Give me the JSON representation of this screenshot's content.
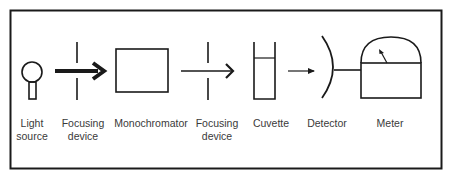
{
  "diagram": {
    "components": [
      {
        "id": "light-source",
        "label_line1": "Light",
        "label_line2": "source"
      },
      {
        "id": "focusing-device-1",
        "label_line1": "Focusing",
        "label_line2": "device"
      },
      {
        "id": "monochromator",
        "label_line1": "Monochromator",
        "label_line2": ""
      },
      {
        "id": "focusing-device-2",
        "label_line1": "Focusing",
        "label_line2": "device"
      },
      {
        "id": "cuvette",
        "label_line1": "Cuvette",
        "label_line2": ""
      },
      {
        "id": "detector",
        "label_line1": "Detector",
        "label_line2": ""
      },
      {
        "id": "meter",
        "label_line1": "Meter",
        "label_line2": ""
      }
    ],
    "colors": {
      "stroke": "#1a1a1a",
      "text": "#3a3a3a",
      "background": "#ffffff"
    }
  }
}
